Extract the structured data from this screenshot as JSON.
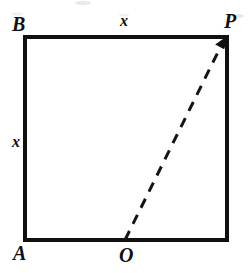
{
  "figure": {
    "kind": "geometry-diagram",
    "background_color": "#ffffff",
    "stroke_color": "#101010",
    "vertices": {
      "top_left": {
        "id": "B",
        "label": "B",
        "x": 25,
        "y": 37
      },
      "top_right": {
        "id": "P",
        "label": "P",
        "x": 227,
        "y": 37
      },
      "bottom_left": {
        "id": "A",
        "label": "A",
        "x": 25,
        "y": 240
      },
      "bottom_mid": {
        "id": "O",
        "label": "O",
        "x": 125,
        "y": 240
      }
    },
    "square": {
      "left": 25,
      "top": 37,
      "right": 227,
      "bottom": 240,
      "stroke_width": 4
    },
    "side_labels": {
      "top": "x",
      "left": "x"
    },
    "dashed_segment": {
      "from": "O",
      "to": "P",
      "x1": 125,
      "y1": 240,
      "x2": 222,
      "y2": 44,
      "style": "dashed",
      "arrowhead": "at-P",
      "stroke_width": 3,
      "dash_length": 10,
      "gap_length": 8
    }
  }
}
